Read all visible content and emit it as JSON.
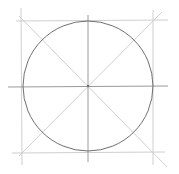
{
  "diagram": {
    "colors": {
      "background": "#ffffff",
      "circle": "#707070",
      "guide_light": "#cfcfcf",
      "guide_axis": "#9a9a9a",
      "center_dot": "#555555"
    },
    "center": [
      88,
      86
    ],
    "radius": 65,
    "guides": [
      {
        "name": "top-horizontal-line",
        "x1": 16,
        "y1": 21,
        "x2": 168,
        "y2": 20
      },
      {
        "name": "bottom-horizontal-line",
        "x1": 12,
        "y1": 153,
        "x2": 165,
        "y2": 152
      },
      {
        "name": "left-vertical-line",
        "x1": 21,
        "y1": 8,
        "x2": 22,
        "y2": 165
      },
      {
        "name": "right-vertical-line",
        "x1": 153,
        "y1": 10,
        "x2": 153,
        "y2": 165
      },
      {
        "name": "diagonal-line-main",
        "x1": 19,
        "y1": 16,
        "x2": 167,
        "y2": 167
      },
      {
        "name": "diagonal-line-anti",
        "x1": 162,
        "y1": 12,
        "x2": 19,
        "y2": 156
      }
    ],
    "axes": [
      {
        "name": "horizontal-axis-line",
        "x1": 8,
        "y1": 87,
        "x2": 168,
        "y2": 86
      },
      {
        "name": "vertical-axis-line",
        "x1": 88,
        "y1": 15,
        "x2": 88,
        "y2": 162
      }
    ]
  }
}
